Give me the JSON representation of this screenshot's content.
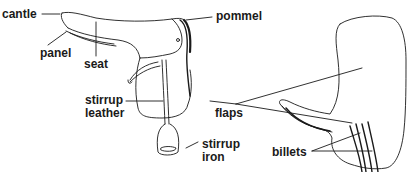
{
  "diagram": {
    "line_color": "#1a1a1a",
    "background": "#ffffff",
    "labels": {
      "cantle": "cantle",
      "pommel": "pommel",
      "panel": "panel",
      "seat": "seat",
      "stirrup_leather_1": "stirrup",
      "stirrup_leather_2": "leather",
      "stirrup_iron_1": "stirrup",
      "stirrup_iron_2": "iron",
      "flaps": "flaps",
      "billets": "billets"
    }
  }
}
